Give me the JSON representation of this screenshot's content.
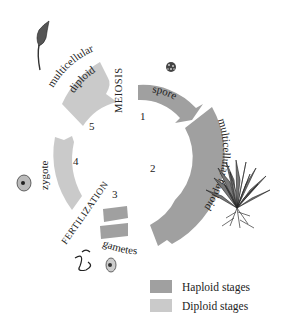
{
  "diagram": {
    "type": "life-cycle",
    "colors": {
      "haploid": "#a0a0a0",
      "diploid": "#cacaca",
      "text": "#222222"
    },
    "stages": [
      {
        "number": "1",
        "label": "spore",
        "ploidy": "haploid"
      },
      {
        "number": "2",
        "label": "multicellular haploid",
        "ploidy": "haploid"
      },
      {
        "number": "3",
        "label": "gametes",
        "ploidy": "haploid"
      },
      {
        "number": "4",
        "label": "zygote",
        "ploidy": "diploid"
      },
      {
        "number": "5",
        "label": "multicellular diploid",
        "ploidy": "diploid"
      }
    ],
    "transitions": {
      "meiosis": "MEIOSIS",
      "fertilization": "FERTILIZATION"
    },
    "illustrations": [
      "sporophyte-icon",
      "spore-icon",
      "moss-plant-icon",
      "zygote-icon",
      "sperm-icon",
      "egg-icon"
    ]
  },
  "legend": {
    "items": [
      {
        "label": "Haploid stages",
        "color": "#a0a0a0"
      },
      {
        "label": "Diploid stages",
        "color": "#cacaca"
      }
    ]
  },
  "labels": {
    "n1": "1",
    "n2": "2",
    "n3": "3",
    "n4": "4",
    "n5": "5",
    "spore": "spore",
    "multi_haploid": "multicellular haploid",
    "gametes": "gametes",
    "zygote": "zygote",
    "multi_diploid_1": "multicellular",
    "multi_diploid_2": "diploid",
    "meiosis": "MEIOSIS",
    "fertilization": "FERTILIZATION"
  }
}
